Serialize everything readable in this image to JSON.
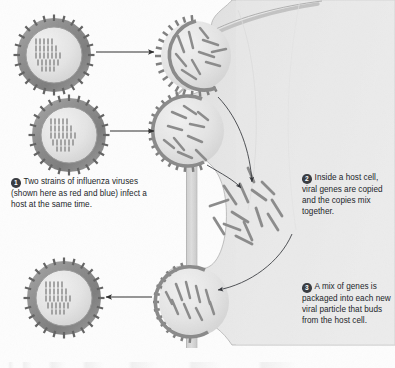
{
  "figure": {
    "background_color": "#fdfdfd",
    "cell_fill_color": "#e8e8e8",
    "cell_edge_color": "#b9b9b9",
    "virus_envelope_color": "#8c8c8c",
    "virus_interior_color": "#e6e6e6",
    "gene_segment_color": "#8a8a8a",
    "arrow_color": "#2e2e2e",
    "badge_color": "#3a3d42",
    "text_color": "#23262a"
  },
  "callouts": [
    {
      "number": "1",
      "text": "Two strains of influenza viruses (shown here as red and blue) infect a host at the same time."
    },
    {
      "number": "2",
      "text": "Inside a host cell, viral genes are copied and the copies mix together."
    },
    {
      "number": "3",
      "text": "A mix of genes is packaged into each new viral particle that buds from the host cell."
    }
  ],
  "caption": {
    "label": "",
    "text": ""
  },
  "viruses": [
    {
      "name": "strain-a-virion",
      "position": "top-left",
      "cx": 54,
      "cy": 55,
      "r": 37,
      "segment_rows": 8,
      "description": "Influenza virion of strain A with eight gene segments"
    },
    {
      "name": "strain-b-virion",
      "position": "middle-left",
      "cx": 69,
      "cy": 135,
      "r": 37,
      "segment_rows": 8,
      "description": "Influenza virion of strain B with eight gene segments"
    },
    {
      "name": "reassortant-virion",
      "position": "bottom-left",
      "cx": 64,
      "cy": 298,
      "r": 37,
      "segment_rows": 8,
      "description": "New reassortant virion containing a mix of gene segments"
    }
  ],
  "budding_sites": [
    {
      "name": "budding-site-top",
      "cx": 196,
      "cy": 56,
      "r": 36
    },
    {
      "name": "budding-site-middle",
      "cx": 189,
      "cy": 131,
      "r": 36
    },
    {
      "name": "budding-site-bottom",
      "cx": 194,
      "cy": 302,
      "r": 36
    }
  ],
  "gene_pool": {
    "name": "mixed-gene-pool",
    "cx": 252,
    "cy": 215,
    "description": "Replicated gene segments from both strains mixing in the cytoplasm"
  },
  "arrows": [
    {
      "name": "arrow-infect-top",
      "direction": "right",
      "from": [
        95,
        52
      ],
      "to": [
        156,
        52
      ]
    },
    {
      "name": "arrow-infect-middle",
      "direction": "right",
      "from": [
        108,
        131
      ],
      "to": [
        156,
        131
      ]
    },
    {
      "name": "arrow-genes-from-top-bud",
      "direction": "curve-down",
      "from": [
        218,
        98
      ],
      "to": [
        252,
        186
      ]
    },
    {
      "name": "arrow-genes-from-middle-bud",
      "direction": "curve-down",
      "from": [
        205,
        168
      ],
      "to": [
        243,
        192
      ]
    },
    {
      "name": "arrow-genes-to-bud",
      "direction": "curve-down-left",
      "from": [
        290,
        238
      ],
      "to": [
        214,
        292
      ]
    },
    {
      "name": "arrow-release",
      "direction": "left",
      "from": [
        152,
        297
      ],
      "to": [
        104,
        297
      ]
    }
  ]
}
